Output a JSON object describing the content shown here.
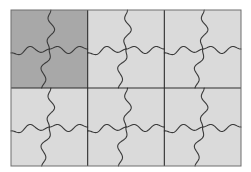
{
  "diagram": {
    "title": "",
    "grid": {
      "x": 11,
      "y": 10,
      "width": 230,
      "height": 156,
      "columns": 3,
      "rows": 2
    },
    "colors": {
      "tile_default": "#dadada",
      "tile_highlight": "#a8a8a8",
      "line": "#3a3a3a",
      "grid_line": "#2c2c2c",
      "frame": "#6e6e6e"
    },
    "cells": [
      {
        "row": 0,
        "col": 0,
        "highlighted": true
      },
      {
        "row": 0,
        "col": 1,
        "highlighted": false
      },
      {
        "row": 0,
        "col": 2,
        "highlighted": false
      },
      {
        "row": 1,
        "col": 0,
        "highlighted": false
      },
      {
        "row": 1,
        "col": 1,
        "highlighted": false
      },
      {
        "row": 1,
        "col": 2,
        "highlighted": false
      }
    ],
    "pattern": "pinwheel wavy tessellation (4 wavy arms per square meeting at center)"
  }
}
